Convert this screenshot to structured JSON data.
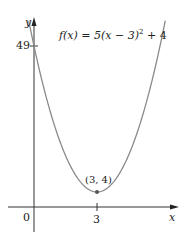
{
  "chart_data": {
    "type": "line",
    "title": "",
    "function_label": "f(x) = 5(x − 3)² + 4",
    "xlabel": "x",
    "ylabel": "y",
    "x_ticks": [
      {
        "value": 3,
        "label": "3"
      }
    ],
    "y_ticks": [
      {
        "value": 49,
        "label": "49"
      }
    ],
    "origin_label": "0",
    "annotations": [
      {
        "x": 3,
        "y": 4,
        "label": "(3, 4)"
      }
    ],
    "series": [
      {
        "name": "f(x) = 5(x − 3)² + 4",
        "x": [
          0,
          0.5,
          1,
          1.5,
          2,
          2.5,
          3,
          3.5,
          4,
          4.5,
          5,
          5.5,
          6
        ],
        "values": [
          49,
          35.25,
          24,
          15.25,
          9,
          5.25,
          4,
          5.25,
          9,
          15.25,
          24,
          35.25,
          49
        ]
      }
    ],
    "grid": false,
    "colors": {
      "curve": "#8a8a8a",
      "axes": "#333333",
      "point": "#555555"
    }
  },
  "labels": {
    "y_axis": "y",
    "x_axis": "x",
    "origin": "0",
    "tick_49": "49",
    "tick_3": "3",
    "vertex": "(3, 4)",
    "fn_prefix": "f(x) = 5(x − 3)",
    "fn_exp": "2",
    "fn_suffix": " + 4"
  }
}
